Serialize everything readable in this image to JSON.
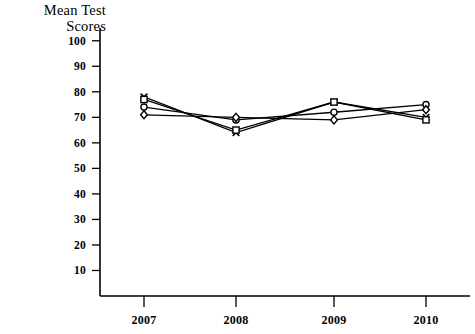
{
  "chart_data": {
    "type": "line",
    "title": "Mean Test\nScores",
    "title_line1": "Mean Test",
    "title_line2": "Scores",
    "xlabel": "",
    "ylabel": "Mean Test Scores",
    "categories": [
      "2007",
      "2008",
      "2009",
      "2010"
    ],
    "ylim": [
      0,
      105
    ],
    "ytick_labels": [
      "10",
      "20",
      "30",
      "40",
      "50",
      "60",
      "70",
      "80",
      "90",
      "100"
    ],
    "ytick_values": [
      10,
      20,
      30,
      40,
      50,
      60,
      70,
      80,
      90,
      100
    ],
    "grid": false,
    "legend": "none",
    "series": [
      {
        "name": "series-1",
        "marker": "x-cross",
        "values": [
          78,
          64,
          76,
          70
        ]
      },
      {
        "name": "series-2",
        "marker": "square",
        "values": [
          77,
          65,
          76,
          69
        ]
      },
      {
        "name": "series-3",
        "marker": "circle",
        "values": [
          74,
          69,
          72,
          75
        ]
      },
      {
        "name": "series-4",
        "marker": "diamond",
        "values": [
          71,
          70,
          69,
          73
        ]
      }
    ]
  },
  "geometry": {
    "plot_left": 100,
    "plot_right": 470,
    "plot_bottom": 296,
    "axis_top": 28,
    "value_at_bottom": 0,
    "value_at_top": 105,
    "category_x": [
      144,
      236,
      334,
      426
    ]
  }
}
